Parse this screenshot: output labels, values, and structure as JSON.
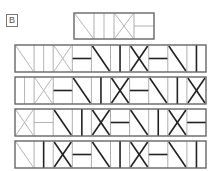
{
  "label": "B",
  "colors": {
    "light": "#b5b5b5",
    "dark": "#222222",
    "border": "#666666"
  },
  "cell_types": {
    "diag": "backslash diagonal",
    "vbar": "vertical center line",
    "cross": "X cross",
    "hbar": "horizontal center line"
  },
  "question": {
    "cells": [
      {
        "type": "diag",
        "shade": "light"
      },
      {
        "type": "vbar",
        "shade": "light"
      },
      {
        "type": "cross",
        "shade": "light"
      },
      {
        "type": "hbar",
        "shade": "light"
      }
    ]
  },
  "options": [
    {
      "cells": [
        {
          "type": "diag",
          "shade": "light"
        },
        {
          "type": "vbar",
          "shade": "light"
        },
        {
          "type": "cross",
          "shade": "light"
        },
        {
          "type": "hbar",
          "shade": "dark"
        },
        {
          "type": "diag",
          "shade": "dark"
        },
        {
          "type": "vbar",
          "shade": "dark"
        },
        {
          "type": "cross",
          "shade": "dark"
        },
        {
          "type": "hbar",
          "shade": "dark"
        },
        {
          "type": "diag",
          "shade": "dark"
        },
        {
          "type": "vbar",
          "shade": "dark"
        }
      ]
    },
    {
      "cells": [
        {
          "type": "vbar",
          "shade": "light"
        },
        {
          "type": "cross",
          "shade": "light"
        },
        {
          "type": "hbar",
          "shade": "dark"
        },
        {
          "type": "diag",
          "shade": "dark"
        },
        {
          "type": "vbar",
          "shade": "dark"
        },
        {
          "type": "cross",
          "shade": "dark"
        },
        {
          "type": "hbar",
          "shade": "dark"
        },
        {
          "type": "diag",
          "shade": "dark"
        },
        {
          "type": "vbar",
          "shade": "dark"
        },
        {
          "type": "cross",
          "shade": "dark"
        }
      ]
    },
    {
      "cells": [
        {
          "type": "cross",
          "shade": "light"
        },
        {
          "type": "hbar",
          "shade": "light"
        },
        {
          "type": "diag",
          "shade": "dark"
        },
        {
          "type": "vbar",
          "shade": "dark"
        },
        {
          "type": "cross",
          "shade": "dark"
        },
        {
          "type": "hbar",
          "shade": "dark"
        },
        {
          "type": "diag",
          "shade": "dark"
        },
        {
          "type": "vbar",
          "shade": "dark"
        },
        {
          "type": "cross",
          "shade": "dark"
        },
        {
          "type": "hbar",
          "shade": "dark"
        }
      ]
    },
    {
      "cells": [
        {
          "type": "diag",
          "shade": "light"
        },
        {
          "type": "vbar",
          "shade": "dark"
        },
        {
          "type": "cross",
          "shade": "dark"
        },
        {
          "type": "hbar",
          "shade": "dark"
        },
        {
          "type": "diag",
          "shade": "dark"
        },
        {
          "type": "vbar",
          "shade": "dark"
        },
        {
          "type": "cross",
          "shade": "dark"
        },
        {
          "type": "hbar",
          "shade": "dark"
        },
        {
          "type": "diag",
          "shade": "dark"
        },
        {
          "type": "vbar",
          "shade": "dark"
        }
      ]
    }
  ]
}
